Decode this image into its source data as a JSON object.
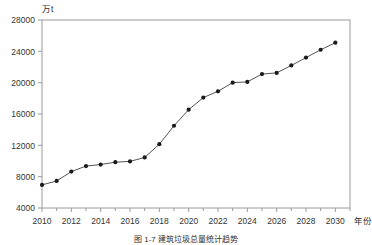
{
  "figure": {
    "unit_label": "万t",
    "caption": "图 1-7  建筑垃圾总量统计趋势",
    "axis_name_x": "年份"
  },
  "chart_data": {
    "type": "line",
    "title": "",
    "subtitle": "",
    "xlabel": "年份",
    "ylabel": "万t",
    "xlim": [
      2010,
      2031
    ],
    "ylim": [
      4000,
      28000
    ],
    "grid": false,
    "legend": "none",
    "marker": "filled-circle",
    "line_color": "#555555",
    "marker_color": "#1a1a1a",
    "frame_color": "#9a9a9a",
    "xticks": [
      2010,
      2012,
      2014,
      2016,
      2018,
      2020,
      2022,
      2024,
      2026,
      2028,
      2030
    ],
    "xtick_labels": [
      "2010",
      "2012",
      "2014",
      "2016",
      "2018",
      "2020",
      "2022",
      "2024",
      "2026",
      "2028",
      "2030"
    ],
    "yticks": [
      4000,
      8000,
      12000,
      16000,
      20000,
      24000,
      28000
    ],
    "ytick_labels": [
      "4000",
      "8000",
      "12000",
      "16000",
      "20000",
      "24000",
      "28000"
    ],
    "x": [
      2010,
      2011,
      2012,
      2013,
      2014,
      2015,
      2016,
      2017,
      2018,
      2019,
      2020,
      2021,
      2022,
      2023,
      2024,
      2025,
      2026,
      2027,
      2028,
      2029,
      2030
    ],
    "values": [
      6950,
      7450,
      8650,
      9350,
      9550,
      9850,
      9950,
      10450,
      12150,
      14500,
      16550,
      18100,
      18900,
      20000,
      20100,
      21100,
      21250,
      22200,
      23200,
      24200,
      25100
    ],
    "series": [
      {
        "name": "建筑垃圾总量",
        "values": [
          6950,
          7450,
          8650,
          9350,
          9550,
          9850,
          9950,
          10450,
          12150,
          14500,
          16550,
          18100,
          18900,
          20000,
          20100,
          21100,
          21250,
          22200,
          23200,
          24200,
          25100
        ]
      }
    ]
  }
}
